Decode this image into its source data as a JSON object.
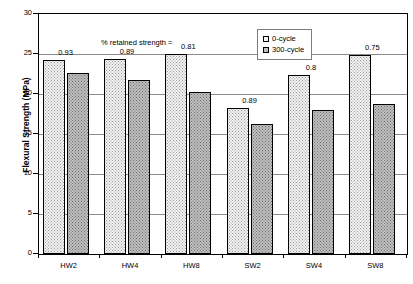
{
  "chart_data": {
    "type": "bar",
    "title": "",
    "xlabel": "",
    "ylabel": "Flexural Strength (MPa)",
    "ylim": [
      0,
      30
    ],
    "ytick_step": 5,
    "yticks": [
      0,
      5,
      10,
      15,
      20,
      25,
      30
    ],
    "ytick_labels": [
      "0",
      "5",
      "10",
      "15",
      "20",
      "25",
      "30"
    ],
    "grid": true,
    "legend_position": "top-center",
    "categories": [
      "HW2",
      "HW4",
      "HW8",
      "SW2",
      "SW4",
      "SW8"
    ],
    "series": [
      {
        "name": "0-cycle",
        "values": [
          24.3,
          24.4,
          25.0,
          18.3,
          22.4,
          24.9
        ]
      },
      {
        "name": "300-cycle",
        "values": [
          22.6,
          21.7,
          20.3,
          16.2,
          18.0,
          18.8
        ]
      }
    ],
    "annotation": "% retained strength =",
    "data_labels": [
      "0.93",
      "0.89",
      "0.81",
      "0.89",
      "0.8",
      "0.75"
    ],
    "label_anchor": [
      "center",
      "center",
      "center",
      "center",
      "center",
      "center"
    ]
  },
  "legend": {
    "items": [
      {
        "label": "0-cycle",
        "swatch": "series-0-swatch"
      },
      {
        "label": "300-cycle",
        "swatch": "series-1-swatch"
      }
    ]
  }
}
